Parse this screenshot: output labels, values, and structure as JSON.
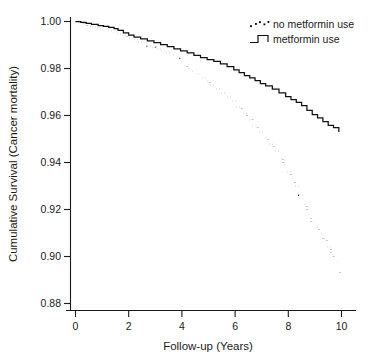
{
  "chart_data": {
    "type": "line",
    "title": "",
    "xlabel": "Follow-up (Years)",
    "ylabel": "Cumulative Survival (Cancer mortality)",
    "xlim": [
      0,
      10.4
    ],
    "ylim": [
      0.878,
      1.002
    ],
    "xticks": [
      0,
      2,
      4,
      6,
      8,
      10
    ],
    "xtick_labels": [
      "0",
      "2",
      "4",
      "6",
      "8",
      "10"
    ],
    "yticks": [
      0.88,
      0.9,
      0.92,
      0.94,
      0.96,
      0.98,
      1.0
    ],
    "ytick_labels": [
      "0.88",
      "0.90",
      "0.92",
      "0.94",
      "0.96",
      "0.98",
      "1.00"
    ],
    "grid": false,
    "legend_position": "top-right",
    "series": [
      {
        "name": "no metformin use",
        "style": "dotted",
        "color": "#111111",
        "x": [
          0.0,
          0.15,
          0.3,
          0.45,
          0.6,
          0.8,
          1.0,
          1.2,
          1.4,
          1.55,
          1.75,
          1.95,
          2.15,
          2.35,
          2.55,
          2.7,
          2.85,
          3.0,
          3.2,
          3.4,
          3.6,
          3.75,
          3.9,
          4.05,
          4.2,
          4.35,
          4.5,
          4.7,
          4.9,
          5.05,
          5.25,
          5.45,
          5.65,
          5.85,
          6.05,
          6.25,
          6.45,
          6.65,
          6.85,
          7.05,
          7.25,
          7.45,
          7.65,
          7.8,
          7.95,
          8.1,
          8.25,
          8.4,
          8.55,
          8.7,
          8.85,
          9.0,
          9.15,
          9.3,
          9.45,
          9.6,
          9.7,
          9.8,
          9.9,
          9.95
        ],
        "y": [
          1.0,
          0.9994,
          0.9988,
          0.9982,
          0.9976,
          0.9971,
          0.9967,
          0.9962,
          0.9956,
          0.9948,
          0.994,
          0.9931,
          0.9922,
          0.9913,
          0.9905,
          0.9897,
          0.989,
          0.9884,
          0.9876,
          0.9868,
          0.9859,
          0.9842,
          0.9826,
          0.9812,
          0.98,
          0.9789,
          0.9778,
          0.9762,
          0.9746,
          0.9731,
          0.9713,
          0.9696,
          0.9678,
          0.966,
          0.9637,
          0.961,
          0.9582,
          0.9556,
          0.953,
          0.9503,
          0.9477,
          0.9449,
          0.9418,
          0.939,
          0.9362,
          0.9332,
          0.93,
          0.9262,
          0.9222,
          0.918,
          0.9148,
          0.9124,
          0.91,
          0.9073,
          0.9042,
          0.9008,
          0.8986,
          0.8978,
          0.894,
          0.8915
        ]
      },
      {
        "name": "metformin use",
        "style": "solid",
        "color": "#111111",
        "x": [
          0.0,
          0.2,
          0.4,
          0.6,
          0.85,
          1.05,
          1.25,
          1.45,
          1.6,
          1.8,
          2.0,
          2.2,
          2.45,
          2.7,
          2.95,
          3.2,
          3.45,
          3.7,
          3.95,
          4.2,
          4.45,
          4.7,
          4.95,
          5.2,
          5.45,
          5.7,
          5.95,
          6.15,
          6.35,
          6.55,
          6.75,
          6.95,
          7.15,
          7.4,
          7.65,
          7.9,
          8.1,
          8.3,
          8.5,
          8.7,
          8.9,
          9.1,
          9.3,
          9.5,
          9.7,
          9.9
        ],
        "y": [
          1.0,
          0.9996,
          0.9992,
          0.9988,
          0.9983,
          0.9979,
          0.9975,
          0.997,
          0.9962,
          0.9952,
          0.9942,
          0.9934,
          0.9926,
          0.9918,
          0.991,
          0.9902,
          0.9893,
          0.9884,
          0.9875,
          0.9866,
          0.9856,
          0.9846,
          0.9838,
          0.983,
          0.982,
          0.9808,
          0.9794,
          0.9782,
          0.977,
          0.976,
          0.9748,
          0.9736,
          0.9726,
          0.9712,
          0.9696,
          0.968,
          0.9668,
          0.9656,
          0.9642,
          0.9622,
          0.9604,
          0.959,
          0.9574,
          0.9558,
          0.9548,
          0.953
        ]
      }
    ]
  },
  "legend": {
    "entries": [
      {
        "label": "no metformin use",
        "marker": "dotted-marker"
      },
      {
        "label": "metformin use",
        "marker": "step-line-marker"
      }
    ]
  },
  "colors": {
    "axis": "#1a1a1a",
    "series": "#111111",
    "background": "#ffffff"
  }
}
